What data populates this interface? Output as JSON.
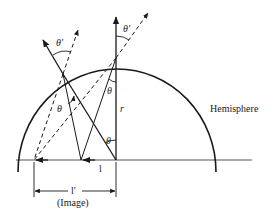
{
  "diagram": {
    "type": "optics-refraction-hemisphere",
    "labels": {
      "hemisphere": "Hemisphere",
      "theta": "θ",
      "theta_prime": "θ′",
      "radius": "r",
      "object_distance": "l",
      "image_distance": "l′",
      "image_caption": "(Image)"
    },
    "colors": {
      "stroke": "#1a1a1a",
      "background": "#ffffff"
    }
  }
}
